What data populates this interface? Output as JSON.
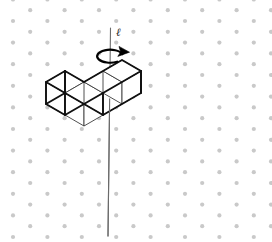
{
  "figure": {
    "name": "polycube-rotation-figure",
    "width": 272,
    "height": 242,
    "background_color": "#ffffff"
  },
  "lattice": {
    "name": "triangular-dot-lattice",
    "dot_color": "#c9c9c9",
    "dot_radius": 2.1,
    "column_spacing": 17.2,
    "row_spacing": 21.6,
    "stagger": "alternate columns offset by half row spacing",
    "origin_x": 13,
    "origin_y": 21,
    "columns": 16,
    "rows": 11
  },
  "axis": {
    "name": "rotation-axis",
    "label": "ℓ",
    "color": "#6b6b6b",
    "stroke_width": 1.1,
    "x_top": 110.5,
    "y_top": 28,
    "x_bottom": 108.0,
    "y_bottom": 236
  },
  "axis_label": {
    "text": "ℓ",
    "x": 116,
    "y": 36
  },
  "rotation_arrow": {
    "name": "rotation-arrow",
    "color": "#000000",
    "stroke_width": 2.2,
    "center_x": 110,
    "center_y": 56,
    "radius_x": 13,
    "radius_y": 6.5,
    "direction": "clockwise-viewed-from-above",
    "arrowhead_x": 123,
    "arrowhead_y": 51
  },
  "polycube": {
    "name": "l-shaped-polycube",
    "cube_count": 4,
    "face_fill": "#ffffff",
    "outline_color": "#111111",
    "outline_width": 1.9,
    "interior_edge_color": "#3c3c3c",
    "interior_edge_width": 0.9,
    "projection": "isometric",
    "unit_dx": 19.0,
    "unit_dy": 11.0,
    "unit_dz": 22.0,
    "origin_x": 46,
    "origin_y": 104,
    "cells": [
      {
        "label": "cell-a",
        "i": 0,
        "j": 0
      },
      {
        "label": "cell-b",
        "i": 1,
        "j": 0
      },
      {
        "label": "cell-c",
        "i": 1,
        "j": 1
      },
      {
        "label": "cell-d",
        "i": 1,
        "j": 2
      }
    ]
  }
}
